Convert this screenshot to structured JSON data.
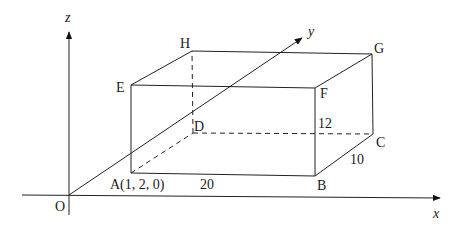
{
  "diagram": {
    "type": "3d-coordinate-box",
    "axes": {
      "x_label": "x",
      "y_label": "y",
      "z_label": "z",
      "origin_label": "O"
    },
    "vertices": {
      "A": "A(1, 2, 0)",
      "B": "B",
      "C": "C",
      "D": "D",
      "E": "E",
      "F": "F",
      "G": "G",
      "H": "H"
    },
    "dimensions": {
      "AB": "20",
      "BC": "10",
      "BF": "12"
    },
    "colors": {
      "line": "#222222",
      "background": "#ffffff"
    }
  }
}
